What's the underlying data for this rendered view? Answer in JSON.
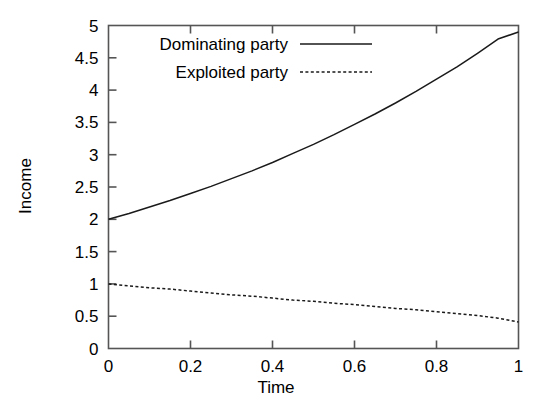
{
  "chart_data": {
    "type": "line",
    "title": "",
    "xlabel": "Time",
    "ylabel": "Income",
    "xlim": [
      0,
      1
    ],
    "ylim": [
      0,
      5
    ],
    "grid": false,
    "legend_position": "top-left-inside",
    "xticks": [
      "0",
      "0.2",
      "0.4",
      "0.6",
      "0.8",
      "1"
    ],
    "xtick_values": [
      0,
      0.2,
      0.4,
      0.6,
      0.8,
      1
    ],
    "yticks": [
      "0",
      "0.5",
      "1",
      "1.5",
      "2",
      "2.5",
      "3",
      "3.5",
      "4",
      "4.5",
      "5"
    ],
    "ytick_values": [
      0,
      0.5,
      1,
      1.5,
      2,
      2.5,
      3,
      3.5,
      4,
      4.5,
      5
    ],
    "x": [
      0,
      0.05,
      0.1,
      0.15,
      0.2,
      0.25,
      0.3,
      0.35,
      0.4,
      0.45,
      0.5,
      0.55,
      0.6,
      0.65,
      0.7,
      0.75,
      0.8,
      0.85,
      0.9,
      0.95,
      1
    ],
    "series": [
      {
        "name": "Dominating party",
        "style": "solid",
        "color": "#1a1a1a",
        "values": [
          2.0,
          2.09,
          2.19,
          2.29,
          2.4,
          2.51,
          2.63,
          2.75,
          2.88,
          3.02,
          3.16,
          3.31,
          3.47,
          3.63,
          3.8,
          3.98,
          4.17,
          4.36,
          4.57,
          4.79,
          4.9
        ]
      },
      {
        "name": "Exploited party",
        "style": "dotted",
        "color": "#1a1a1a",
        "values": [
          1.0,
          0.97,
          0.94,
          0.92,
          0.89,
          0.86,
          0.83,
          0.81,
          0.78,
          0.75,
          0.73,
          0.7,
          0.68,
          0.65,
          0.62,
          0.6,
          0.57,
          0.54,
          0.51,
          0.47,
          0.41
        ]
      }
    ]
  },
  "legend": {
    "entries": [
      {
        "label": "Dominating party",
        "style": "solid"
      },
      {
        "label": "Exploited party",
        "style": "dotted"
      }
    ]
  },
  "colors": {
    "background": "#ffffff",
    "axis": "#555555",
    "curve": "#1a1a1a"
  }
}
